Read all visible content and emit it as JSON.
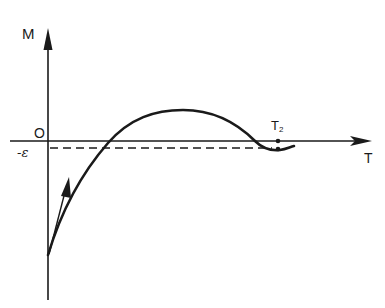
{
  "diagram": {
    "type": "function-sketch",
    "axes": {
      "y_label": "M",
      "x_label": "T",
      "origin_label": "O"
    },
    "annotations": {
      "epsilon_label": "-ε",
      "t2_label": "T",
      "t2_subscript": "2"
    },
    "curve": {
      "description": "M(T) starts negative at T=0 with positive slope (tangent arrow), rises through zero, reaches a maximum, falls back slightly below zero to about -ε at T2",
      "stroke": "#1a1a1a"
    },
    "dashed_line": {
      "level": "-ε"
    },
    "colors": {
      "ink": "#1a1a1a",
      "background": "#ffffff"
    }
  }
}
